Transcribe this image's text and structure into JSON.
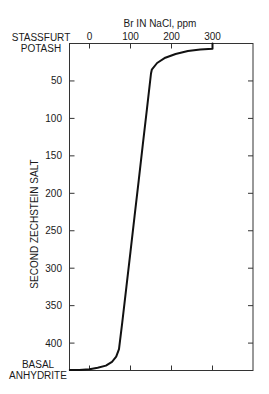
{
  "chart_data": {
    "type": "line",
    "title": "",
    "xlabel": "Br IN NaCl, ppm",
    "ylabel": "SECOND ZECHSTEIN SALT",
    "x_ticks": [
      0,
      100,
      200,
      300
    ],
    "x_tick_labels": [
      "0",
      "100",
      "200",
      "300"
    ],
    "y_ticks": [
      50,
      100,
      150,
      200,
      250,
      300,
      350,
      400
    ],
    "y_tick_labels": [
      "50",
      "100",
      "150",
      "200",
      "250",
      "300",
      "350",
      "400"
    ],
    "xlim": [
      -50,
      400
    ],
    "ylim": [
      436,
      0
    ],
    "y_inverted": true,
    "x_axis_position": "top",
    "grid": false,
    "annotations": {
      "top": [
        "STASSFURT",
        "POTASH"
      ],
      "bottom": [
        "BASAL",
        "ANHYDRITE"
      ]
    },
    "series": [
      {
        "name": "Br content",
        "x": [
          300,
          300,
          270,
          240,
          210,
          185,
          165,
          152,
          150,
          140,
          130,
          120,
          110,
          100,
          90,
          80,
          72,
          65,
          55,
          40,
          20,
          0,
          -25,
          -48
        ],
        "y": [
          0,
          7,
          8,
          10,
          14,
          19,
          26,
          35,
          40,
          88,
          135,
          183,
          230,
          278,
          325,
          372,
          408,
          418,
          425,
          430,
          433,
          435,
          436,
          436
        ]
      }
    ]
  }
}
